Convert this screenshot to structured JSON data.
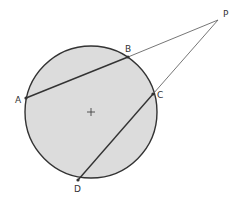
{
  "diagram": {
    "type": "geometry-circle-secants",
    "colors": {
      "background": "#ffffff",
      "circle_fill": "#dcdcdc",
      "circle_stroke": "#333333",
      "chord_stroke": "#333333",
      "secant_stroke": "#666666",
      "label": "#333333"
    },
    "circle": {
      "cx": 91,
      "cy": 112,
      "r": 66
    },
    "center_mark": {
      "x": 91,
      "y": 112,
      "size": 4
    },
    "points": {
      "A": {
        "x": 26,
        "y": 98,
        "label": "A",
        "lx": 15,
        "ly": 103
      },
      "B": {
        "x": 128,
        "y": 57,
        "label": "B",
        "lx": 125,
        "ly": 52
      },
      "C": {
        "x": 153,
        "y": 94,
        "label": "C",
        "lx": 157,
        "ly": 98
      },
      "D": {
        "x": 78,
        "y": 180,
        "label": "D",
        "lx": 74,
        "ly": 192
      },
      "P": {
        "x": 218,
        "y": 20,
        "label": "P",
        "lx": 223,
        "ly": 17
      }
    },
    "segments": [
      {
        "from": "A",
        "to": "B",
        "kind": "chord"
      },
      {
        "from": "B",
        "to": "P",
        "kind": "external"
      },
      {
        "from": "D",
        "to": "C",
        "kind": "chord"
      },
      {
        "from": "C",
        "to": "P",
        "kind": "external"
      }
    ]
  }
}
